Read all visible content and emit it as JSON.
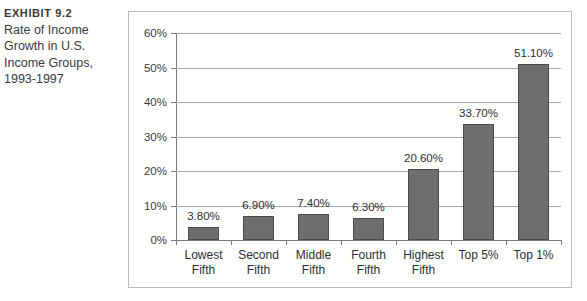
{
  "caption": {
    "exhibit_label": "Exhibit 9.2",
    "lines": [
      "Rate of Income",
      "Growth in U.S.",
      "Income Groups,",
      "1993-1997"
    ]
  },
  "chart_data": {
    "type": "bar",
    "title": "",
    "xlabel": "",
    "ylabel": "",
    "categories": [
      "Lowest Fifth",
      "Second Fifth",
      "Middle Fifth",
      "Fourth Fifth",
      "Highest Fifth",
      "Top 5%",
      "Top 1%"
    ],
    "category_lines": [
      [
        "Lowest",
        "Fifth"
      ],
      [
        "Second",
        "Fifth"
      ],
      [
        "Middle",
        "Fifth"
      ],
      [
        "Fourth",
        "Fifth"
      ],
      [
        "Highest",
        "Fifth"
      ],
      [
        "Top 5%",
        ""
      ],
      [
        "Top 1%",
        ""
      ]
    ],
    "values": [
      3.8,
      6.9,
      7.4,
      6.3,
      20.6,
      33.7,
      51.1
    ],
    "data_labels": [
      "3.80%",
      "6.90%",
      "7.40%",
      "6.30%",
      "20.60%",
      "33.70%",
      "51.10%"
    ],
    "ylim": [
      0,
      60
    ],
    "ytick_values": [
      0,
      10,
      20,
      30,
      40,
      50,
      60
    ],
    "ytick_labels": [
      "0%",
      "10%",
      "20%",
      "30%",
      "40%",
      "50%",
      "60%"
    ],
    "grid": true,
    "legend": "none",
    "bar_color": "#6e6e6e",
    "bar_border_color": "#4a4a4a",
    "gridline_color": "#a8a8a8",
    "axis_color": "#7a7a7a",
    "frame_color": "#b9b9b9",
    "text_color": "#2e2e2e"
  }
}
